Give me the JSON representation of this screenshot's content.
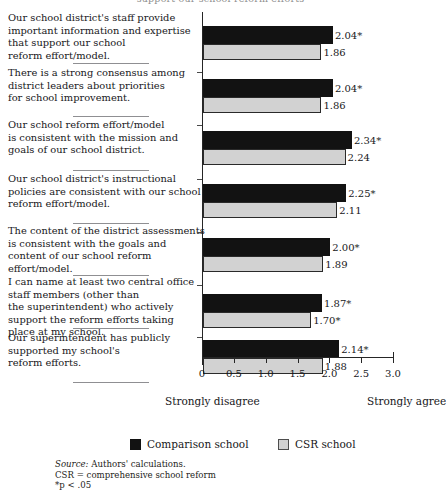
{
  "figure": {
    "clipped_top_text": "support our school reform efforts",
    "axis": {
      "ticks": [
        "0",
        "0.5",
        "1.0",
        "1.5",
        "2.0",
        "2.5",
        "3.0"
      ],
      "tick_values": [
        0,
        0.5,
        1.0,
        1.5,
        2.0,
        2.5,
        3.0
      ],
      "min": 0,
      "max": 3.0
    },
    "anchor_left": "Strongly disagree",
    "anchor_right": "Strongly agree",
    "legend": [
      {
        "label": "Comparison school",
        "swatch": "black-square-icon",
        "color": "#121212"
      },
      {
        "label": "CSR school",
        "swatch": "gray-square-icon",
        "color": "#d2d2d2"
      }
    ],
    "notes": {
      "source_word": "Source:",
      "source_text": " Authors' calculations.",
      "abbrev": "CSR  =  comprehensive school reform",
      "significance": "*p < .05"
    }
  },
  "chart_data": {
    "type": "bar",
    "title": "",
    "xlabel": "",
    "ylabel": "",
    "xlim": [
      0,
      3.0
    ],
    "grid": false,
    "orientation": "horizontal",
    "legend_position": "bottom",
    "axis_anchors": {
      "low": "Strongly disagree",
      "high": "Strongly agree"
    },
    "categories": [
      "Our school district's staff provide important information and expertise that support our school reform effort/model.",
      "There is a strong consensus among district leaders about priorities for school improvement.",
      "Our school reform effort/model is consistent with the mission and goals of our school district.",
      "Our school district's instructional policies are consistent with our school reform effort/model.",
      "The content of the district assessments is consistent with the goals and content of our school reform effort/model.",
      "I can name at least two central office staff members (other than the superintendent) who actively support the reform efforts taking place at my school.",
      "Our superintendent has publicly supported my school's reform efforts."
    ],
    "category_lines": [
      [
        "Our school district's staff provide",
        "important information and expertise",
        "that support our school",
        "reform effort/model."
      ],
      [
        "There is a strong consensus among",
        "district leaders about priorities",
        "for school improvement."
      ],
      [
        "Our school reform effort/model",
        "is consistent with the mission and",
        "goals of our school district."
      ],
      [
        "Our school district's instructional",
        "policies are consistent with our school",
        "reform effort/model."
      ],
      [
        "The content of the district assessments",
        "is consistent with the goals and",
        "content of our school reform",
        "effort/model."
      ],
      [
        "I can name at least two central office",
        "staff members (other than",
        "the superintendent) who actively",
        "support the reform efforts taking",
        "place at my school."
      ],
      [
        "Our superintendent has publicly",
        "supported my school's",
        "reform efforts."
      ]
    ],
    "series": [
      {
        "name": "Comparison school",
        "color": "#121212",
        "values": [
          2.04,
          2.04,
          2.34,
          2.25,
          2.0,
          1.87,
          2.14
        ],
        "labels": [
          "2.04*",
          "2.04*",
          "2.34*",
          "2.25*",
          "2.00*",
          "1.87*",
          "2.14*"
        ]
      },
      {
        "name": "CSR school",
        "color": "#d2d2d2",
        "values": [
          1.86,
          1.86,
          2.24,
          2.11,
          1.89,
          1.7,
          1.88
        ],
        "labels": [
          "1.86",
          "1.86",
          "2.24",
          "2.11",
          "1.89",
          "1.70*",
          "1.88"
        ]
      }
    ]
  }
}
